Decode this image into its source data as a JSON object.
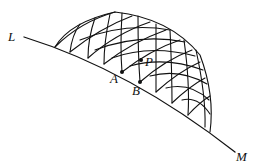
{
  "diagram": {
    "labels": {
      "L": "L",
      "M": "M",
      "A": "A",
      "B": "B",
      "P": "P"
    },
    "stroke_color": "#111111",
    "background": "#ffffff"
  }
}
